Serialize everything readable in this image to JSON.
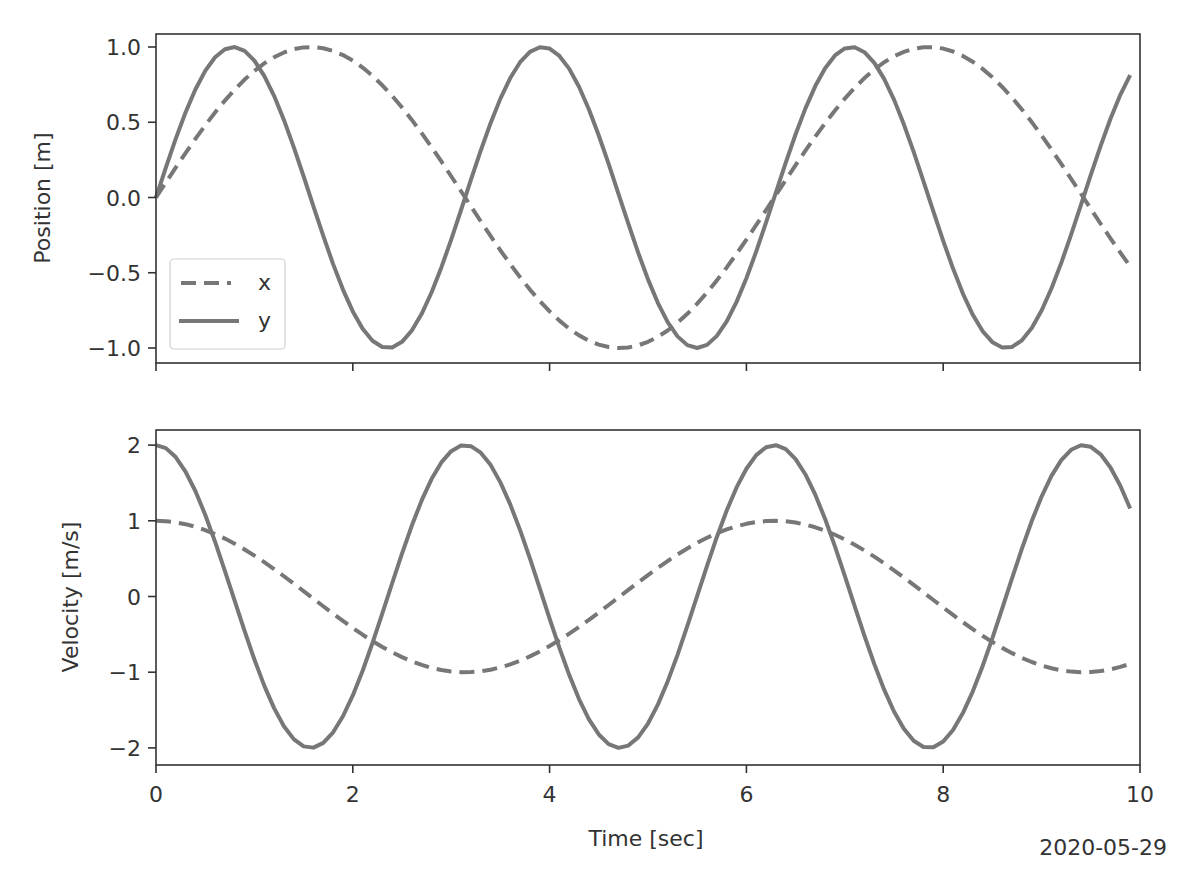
{
  "figure": {
    "date_stamp": "2020-05-29",
    "line_color": "#777777",
    "axis_color": "#333333"
  },
  "chart_data": [
    {
      "type": "line",
      "title": "",
      "xlabel": "",
      "ylabel": "Position [m]",
      "xlim": [
        0,
        10
      ],
      "ylim": [
        -1.1,
        1.05
      ],
      "xticks": [
        0,
        2,
        4,
        6,
        8,
        10
      ],
      "xtick_labels_visible": false,
      "yticks": [
        1.0,
        0.5,
        0.0,
        -0.5,
        -1.0
      ],
      "ytick_labels": [
        "1.0",
        "0.5",
        "0.0",
        "−0.5",
        "−1.0"
      ],
      "grid": false,
      "legend": {
        "position": "lower left",
        "entries": [
          {
            "label": "x",
            "style": "dashed"
          },
          {
            "label": "y",
            "style": "solid"
          }
        ]
      },
      "x": {
        "start": 0,
        "stop": 9.9,
        "step": 0.1
      },
      "series": [
        {
          "name": "x",
          "style": "dashed",
          "function": "sin(t)",
          "amplitude": 1,
          "frequency": 1,
          "phase": "sin"
        },
        {
          "name": "y",
          "style": "solid",
          "function": "sin(2t)",
          "amplitude": 1,
          "frequency": 2,
          "phase": "sin"
        }
      ]
    },
    {
      "type": "line",
      "title": "",
      "xlabel": "Time [sec]",
      "ylabel": "Velocity [m/s]",
      "xlim": [
        0,
        10
      ],
      "ylim": [
        -2.2,
        2.2
      ],
      "xticks": [
        0,
        2,
        4,
        6,
        8,
        10
      ],
      "xtick_labels": [
        "0",
        "2",
        "4",
        "6",
        "8",
        "10"
      ],
      "yticks": [
        2,
        1,
        0,
        -1,
        -2
      ],
      "ytick_labels": [
        "2",
        "1",
        "0",
        "−1",
        "−2"
      ],
      "grid": false,
      "x": {
        "start": 0,
        "stop": 9.9,
        "step": 0.1
      },
      "series": [
        {
          "name": "x",
          "style": "dashed",
          "function": "cos(t)",
          "amplitude": 1,
          "frequency": 1,
          "phase": "cos"
        },
        {
          "name": "y",
          "style": "solid",
          "function": "2cos(2t)",
          "amplitude": 2,
          "frequency": 2,
          "phase": "cos"
        }
      ]
    }
  ]
}
